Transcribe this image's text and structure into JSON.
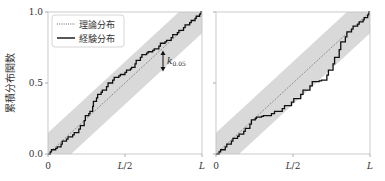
{
  "chart_data": [
    {
      "type": "line",
      "panel": "left",
      "title": "",
      "xlabel": "",
      "ylabel": "累積分布関数",
      "xlim": [
        0,
        1
      ],
      "ylim": [
        0,
        1
      ],
      "x_ticks": [
        "0",
        "L/2",
        "L"
      ],
      "y_ticks": [
        "0.0",
        "0.5",
        "1.0"
      ],
      "grid": false,
      "legend_position": "upper left",
      "band": {
        "name": "confidence band",
        "half_width": 0.15,
        "color": "#d9d9d9"
      },
      "annotation": {
        "text": "k",
        "subscript": "0.05",
        "description": "double-headed arrow showing band half-width"
      },
      "series": [
        {
          "name": "理論分布",
          "style": "dotted",
          "color": "#555555",
          "x": [
            0,
            1
          ],
          "y": [
            0,
            1
          ]
        },
        {
          "name": "経験分布",
          "style": "solid-step",
          "color": "#111111",
          "x": [
            0,
            0.03,
            0.07,
            0.1,
            0.14,
            0.18,
            0.22,
            0.25,
            0.28,
            0.3,
            0.33,
            0.36,
            0.4,
            0.44,
            0.48,
            0.52,
            0.55,
            0.58,
            0.62,
            0.66,
            0.7,
            0.74,
            0.78,
            0.82,
            0.86,
            0.9,
            0.94,
            0.97,
            1.0
          ],
          "y": [
            0,
            0.03,
            0.05,
            0.09,
            0.12,
            0.15,
            0.2,
            0.27,
            0.3,
            0.37,
            0.42,
            0.45,
            0.5,
            0.54,
            0.56,
            0.59,
            0.61,
            0.66,
            0.7,
            0.72,
            0.74,
            0.78,
            0.8,
            0.84,
            0.87,
            0.91,
            0.94,
            0.97,
            1.0
          ]
        }
      ]
    },
    {
      "type": "line",
      "panel": "right",
      "title": "",
      "xlabel": "",
      "ylabel": "",
      "xlim": [
        0,
        1
      ],
      "ylim": [
        0,
        1
      ],
      "x_ticks": [
        "0",
        "L/2",
        "L"
      ],
      "y_ticks": [
        "",
        "",
        ""
      ],
      "grid": false,
      "band": {
        "name": "confidence band",
        "half_width": 0.15,
        "color": "#d9d9d9"
      },
      "series": [
        {
          "name": "理論分布",
          "style": "dotted",
          "color": "#555555",
          "x": [
            0,
            1
          ],
          "y": [
            0,
            1
          ]
        },
        {
          "name": "経験分布",
          "style": "solid-step",
          "color": "#111111",
          "x": [
            0,
            0.04,
            0.08,
            0.12,
            0.16,
            0.2,
            0.24,
            0.27,
            0.32,
            0.4,
            0.46,
            0.52,
            0.58,
            0.64,
            0.7,
            0.74,
            0.78,
            0.82,
            0.86,
            0.9,
            0.94,
            0.97,
            1.0
          ],
          "y": [
            0,
            0.03,
            0.07,
            0.11,
            0.14,
            0.18,
            0.24,
            0.26,
            0.27,
            0.3,
            0.34,
            0.39,
            0.45,
            0.51,
            0.52,
            0.59,
            0.68,
            0.79,
            0.86,
            0.9,
            0.93,
            0.96,
            1.0
          ]
        }
      ]
    }
  ],
  "labels": {
    "ylabel": "累積分布関数",
    "legend_theory": "理論分布",
    "legend_empirical": "経験分布",
    "k_symbol": "k",
    "k_subscript": "0.05",
    "x_tick_0": "0",
    "x_tick_half_L": "L",
    "x_tick_half_rest": "/2",
    "x_tick_L": "L",
    "y_tick_0": "0.0",
    "y_tick_05": "0.5",
    "y_tick_1": "1.0"
  }
}
